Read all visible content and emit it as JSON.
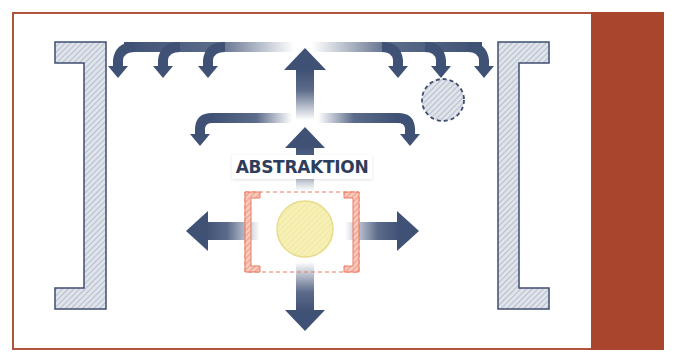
{
  "diagram": {
    "center_label": "ABSTRAKTION",
    "colors": {
      "frame_border": "#b2543a",
      "side_panel": "#a8452c",
      "arrow": "#3f5175",
      "bracket_fill": "#d7dbe4",
      "bracket_stroke": "#3f4d70",
      "core_circle": "#f6eeaa",
      "core_box_border": "#ea7a60",
      "core_bracket_fill": "#f4b3a3"
    },
    "elements": {
      "left_bracket": "large hatched bracket on left",
      "right_bracket": "large hatched bracket on right",
      "dashed_circle": "hatched circle with dashed outline",
      "core": "yellow circle inside dashed red bracketed box",
      "top_arrow_branches": 6,
      "middle_arrow_branches": 2
    }
  }
}
